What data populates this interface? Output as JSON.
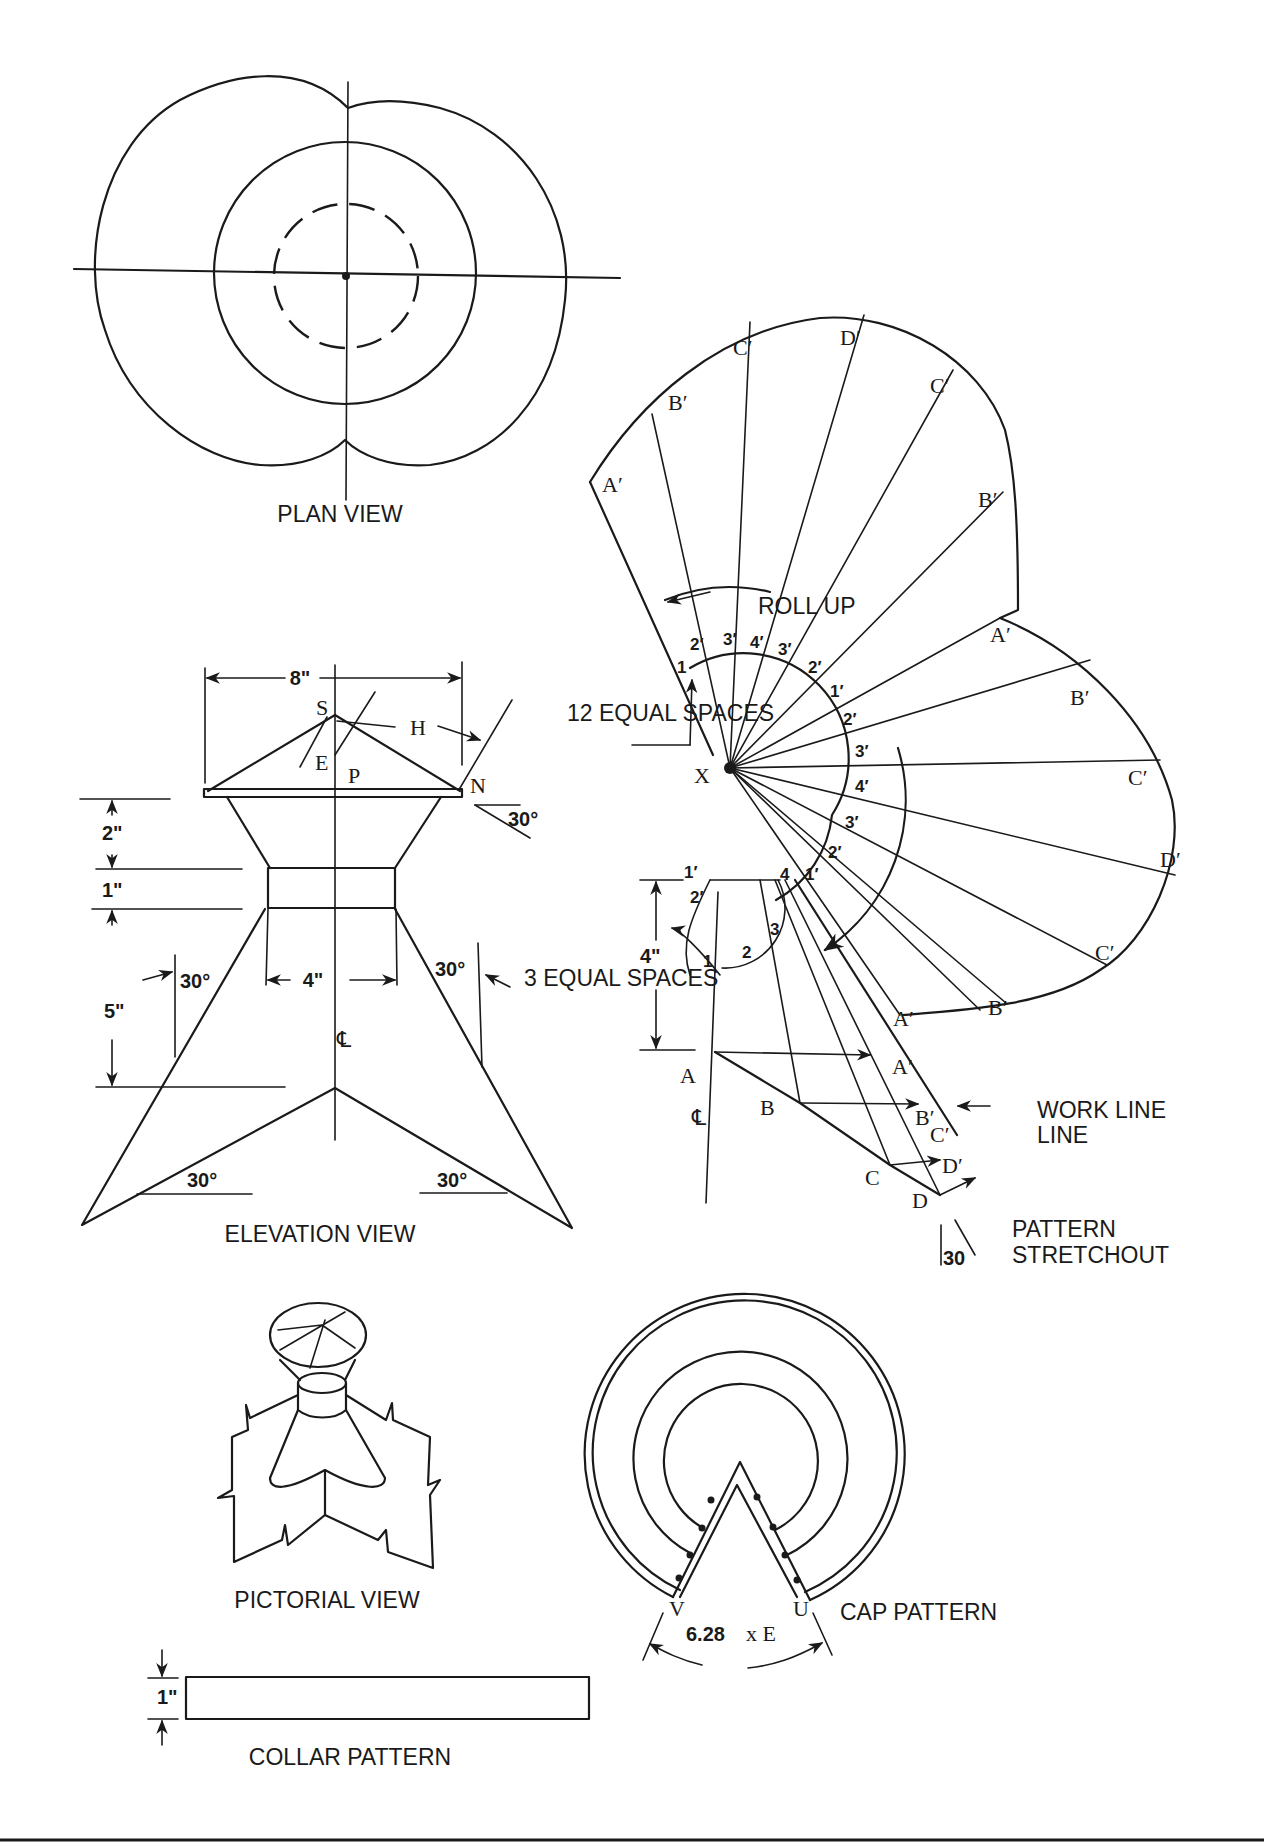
{
  "views": {
    "plan": {
      "title": "PLAN VIEW"
    },
    "elevation": {
      "title": "ELEVATION VIEW",
      "dims": {
        "width_top": "8\"",
        "h_2": "2\"",
        "h_1": "1\"",
        "h_5": "5\"",
        "width_neck": "4\""
      },
      "angles": {
        "cap": "30°",
        "left_leg": "30°",
        "right_leg": "30°",
        "base_left": "30°",
        "base_right": "30°"
      },
      "points": {
        "S": "S",
        "H": "H",
        "E": "E",
        "P": "P",
        "N": "N",
        "CL": "℄"
      },
      "note_equal": "3 EQUAL SPACES"
    },
    "stretchout": {
      "title": "PATTERN STRETCHOUT",
      "roll_up": "ROLL UP",
      "equal_spaces": "12 EQUAL SPACES",
      "work_line": "WORK LINE",
      "center": "X",
      "angle": "30",
      "dim_4": "4\"",
      "outer_labels": [
        "A′",
        "B′",
        "C′",
        "D′",
        "C′",
        "B′",
        "A′",
        "B′",
        "C′",
        "D′",
        "C′",
        "B′"
      ],
      "arc_numbers": [
        "1",
        "2′",
        "3′",
        "4′",
        "3′",
        "2′",
        "1′",
        "2′",
        "3′",
        "4′",
        "3′",
        "2′",
        "1′"
      ],
      "small_arc": [
        "1′",
        "2′",
        "4",
        "3",
        "2",
        "1"
      ],
      "profile_points": [
        "A",
        "B",
        "C",
        "D"
      ],
      "work_points": [
        "A′",
        "A′",
        "B′",
        "C′",
        "D′"
      ],
      "centerline": "℄"
    },
    "pictorial": {
      "title": "PICTORIAL VIEW"
    },
    "cap_pattern": {
      "title": "CAP PATTERN",
      "formula_num": "6.28",
      "formula_var": "x  E",
      "V": "V",
      "U": "U"
    },
    "collar_pattern": {
      "title": "COLLAR PATTERN",
      "height": "1\""
    }
  }
}
